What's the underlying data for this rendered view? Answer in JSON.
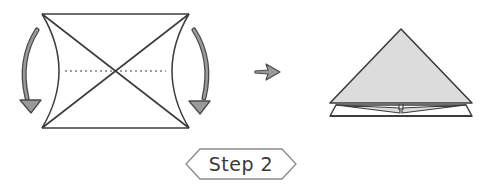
{
  "diagram": {
    "step_label": "Step 2",
    "colors": {
      "line": "#3c3c3c",
      "arrow_fill": "#9a9a9a",
      "paper_fill": "#dcdcdc",
      "badge_border": "#8a8a8a",
      "text": "#3a3a3a"
    },
    "before": {
      "shape": "square-with-diagonals-and-curved-side-folds",
      "fold_arrows": [
        "left-curved-down-arrow",
        "right-curved-down-arrow"
      ],
      "fold_line": "horizontal-dotted-center-line"
    },
    "transition": "right-arrow",
    "after": {
      "shape": "triangle-with-layered-base"
    }
  }
}
